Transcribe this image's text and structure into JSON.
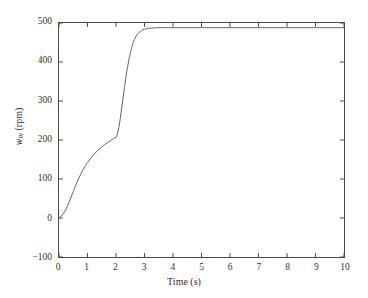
{
  "chart_data": {
    "type": "line",
    "title": "",
    "subtitle": "",
    "xlabel": "Time (s)",
    "ylabel": "w_m (rpm)",
    "ylabel_parts": {
      "symbol": "w",
      "subscript": "m",
      "units": "(rpm)"
    },
    "xlim": [
      0,
      10
    ],
    "ylim": [
      -100,
      500
    ],
    "xticks": [
      0,
      1,
      2,
      3,
      4,
      5,
      6,
      7,
      8,
      9,
      10
    ],
    "xtick_labels": [
      "0",
      "1",
      "2",
      "3",
      "4",
      "5",
      "6",
      "7",
      "8",
      "9",
      "10"
    ],
    "yticks": [
      -100,
      0,
      100,
      200,
      300,
      400,
      500
    ],
    "ytick_labels": [
      "−100",
      "0",
      "100",
      "200",
      "300",
      "400",
      "500"
    ],
    "grid": false,
    "legend": null,
    "legend_position": "none",
    "box": true,
    "tick_direction": "in",
    "line_color": "#555555",
    "line_width": 0.9,
    "annotations": [],
    "series": [
      {
        "name": "motor speed",
        "color": "#555555",
        "x": [
          0.0,
          0.1,
          0.2,
          0.3,
          0.4,
          0.5,
          0.6,
          0.7,
          0.8,
          0.9,
          1.0,
          1.1,
          1.2,
          1.3,
          1.4,
          1.5,
          1.6,
          1.7,
          1.8,
          1.9,
          1.95,
          2.0,
          2.05,
          2.1,
          2.15,
          2.2,
          2.25,
          2.3,
          2.35,
          2.4,
          2.45,
          2.5,
          2.55,
          2.6,
          2.65,
          2.7,
          2.75,
          2.8,
          2.85,
          2.9,
          2.95,
          3.0,
          3.1,
          3.2,
          3.3,
          3.4,
          3.5,
          3.7,
          4.0,
          4.5,
          5.0,
          6.0,
          7.0,
          8.0,
          9.0,
          10.0
        ],
        "y": [
          0,
          6,
          16,
          31,
          49,
          68,
          86,
          103,
          118,
          131,
          142,
          152,
          161,
          169,
          176,
          182,
          188,
          193,
          198,
          203,
          205,
          207,
          215,
          232,
          255,
          282,
          310,
          337,
          362,
          385,
          405,
          422,
          437,
          449,
          458,
          465,
          471,
          475,
          478,
          481,
          483,
          484,
          486,
          487,
          487,
          488,
          488,
          488,
          488,
          488,
          488,
          488,
          488,
          488,
          488,
          488
        ]
      }
    ],
    "steady_state_value": 488,
    "plateau_value": 207,
    "plateau_time": 2.0
  },
  "axes": {
    "x_title": "Time (s)",
    "y_symbol": "w",
    "y_subscript": "m",
    "y_units": "(rpm)"
  }
}
